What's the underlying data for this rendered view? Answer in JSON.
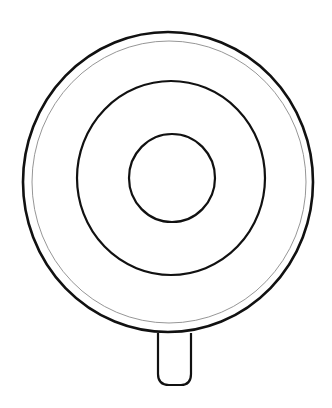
{
  "drawing": {
    "subject": "lollipop line drawing (top view)",
    "background": "#ffffff",
    "stroke_color": "#111111",
    "inner_outline_color": "#8a8a8a",
    "outer_disc": {
      "cx": 168,
      "cy": 182,
      "rx": 145,
      "ry": 150,
      "stroke_width": 2.6
    },
    "outer_inner_outline": {
      "cx": 169,
      "cy": 182,
      "rx": 137,
      "ry": 141,
      "stroke_width": 0.9
    },
    "middle_ring": {
      "cx": 171,
      "cy": 178,
      "rx": 94,
      "ry": 97,
      "stroke_width": 2.2
    },
    "center_circle": {
      "cx": 172,
      "cy": 178,
      "rx": 43,
      "ry": 44,
      "stroke_width": 2.2
    },
    "stick": {
      "x": 157,
      "y": 333,
      "width": 35,
      "height": 52,
      "corner_radius": 10,
      "stroke_width": 2.2
    }
  }
}
